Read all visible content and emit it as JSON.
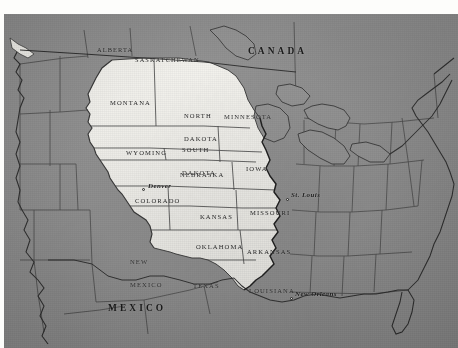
{
  "figure": {
    "kind": "historical-map-scan",
    "palette": {
      "paper_background": "#8d8d8d",
      "territory_fill": "#f2f1ec",
      "outside_fill": "#8d8d8d",
      "border_line": "#2a2a2a",
      "river_line": "#1a1a1a",
      "label_text": "#1d1d1d",
      "margin": "#fdfdfb"
    }
  },
  "countries": [
    {
      "name": "CANADA",
      "x": 244,
      "y": 33
    },
    {
      "name": "MEXICO",
      "x": 104,
      "y": 290
    }
  ],
  "provinces": [
    {
      "name": "ALBERTA",
      "x": 93,
      "y": 33
    },
    {
      "name": "SASKATCHEWAN",
      "x": 131,
      "y": 43
    }
  ],
  "states": [
    {
      "name": "MONTANA",
      "lines": [
        "MONTANA"
      ],
      "x": 106,
      "y": 86,
      "inside": true
    },
    {
      "name": "NORTH DAKOTA",
      "lines": [
        "NORTH",
        "DAKOTA"
      ],
      "x": 180,
      "y": 83,
      "inside": true
    },
    {
      "name": "MINNESOTA",
      "lines": [
        "MINNESOTA"
      ],
      "x": 220,
      "y": 100,
      "inside": false
    },
    {
      "name": "SOUTH DAKOTA",
      "lines": [
        "SOUTH",
        "DAKOTA"
      ],
      "x": 178,
      "y": 117,
      "inside": true
    },
    {
      "name": "WYOMING",
      "lines": [
        "WYOMING"
      ],
      "x": 122,
      "y": 136,
      "inside": true
    },
    {
      "name": "NEBRASKA",
      "lines": [
        "NEBRASKA"
      ],
      "x": 176,
      "y": 158,
      "inside": true
    },
    {
      "name": "IOWA",
      "lines": [
        "IOWA"
      ],
      "x": 242,
      "y": 152,
      "inside": true
    },
    {
      "name": "COLORADO",
      "lines": [
        "COLORADO"
      ],
      "x": 131,
      "y": 184,
      "inside": true
    },
    {
      "name": "KANSAS",
      "lines": [
        "KANSAS"
      ],
      "x": 196,
      "y": 200,
      "inside": true
    },
    {
      "name": "MISSOURI",
      "lines": [
        "MISSOURI"
      ],
      "x": 246,
      "y": 196,
      "inside": true
    },
    {
      "name": "NEW MEXICO",
      "lines": [
        "NEW",
        "MEXICO"
      ],
      "x": 126,
      "y": 229,
      "inside": false
    },
    {
      "name": "OKLAHOMA",
      "lines": [
        "OKLAHOMA"
      ],
      "x": 192,
      "y": 230,
      "inside": true
    },
    {
      "name": "ARKANSAS",
      "lines": [
        "ARKANSAS"
      ],
      "x": 243,
      "y": 235,
      "inside": true
    },
    {
      "name": "TEXAS",
      "lines": [
        "TEXAS"
      ],
      "x": 189,
      "y": 269,
      "inside": false
    },
    {
      "name": "LOUISIANA",
      "lines": [
        "LOUISIANA"
      ],
      "x": 245,
      "y": 274,
      "inside": true
    }
  ],
  "cities": [
    {
      "name": "Denver",
      "label_x": 144,
      "label_y": 171,
      "dot_x": 138,
      "dot_y": 174
    },
    {
      "name": "St. Louis",
      "label_x": 287,
      "label_y": 180,
      "dot_x": 282,
      "dot_y": 184
    },
    {
      "name": "New Orleans",
      "label_x": 291,
      "label_y": 279,
      "dot_x": 286,
      "dot_y": 283
    }
  ]
}
